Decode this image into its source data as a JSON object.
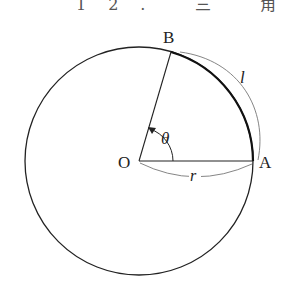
{
  "header": {
    "text": "12. 三 角 関 数"
  },
  "diagram": {
    "points": {
      "O": "O",
      "A": "A",
      "B": "B"
    },
    "labels": {
      "arc_length": "l",
      "radius": "r",
      "angle": "θ"
    },
    "colors": {
      "stroke": "#222222",
      "annotation": "#555555"
    }
  }
}
